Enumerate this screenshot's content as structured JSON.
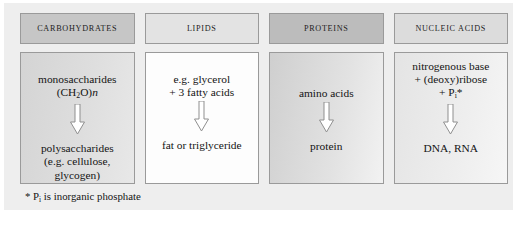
{
  "figure": {
    "columns": [
      {
        "header": "CARBOHYDRATES",
        "header_shade": "shade-a",
        "body_shade": "shade-a",
        "substrate_lines": [
          "monosaccharides",
          "(CH2O)n"
        ],
        "substrate_html": "monosaccharides<br>(CH<sub>2</sub>O)<span class=\"ital\">n</span>",
        "arrow": "down-block-arrow",
        "product_lines": [
          "polysaccharides",
          "(e.g. cellulose,",
          "glycogen)"
        ],
        "product_html": "polysaccharides<br>(e.g. cellulose,<br>glycogen)"
      },
      {
        "header": "LIPIDS",
        "header_shade": "shade-b",
        "body_shade": "shade-b",
        "substrate_lines": [
          "e.g. glycerol",
          "+ 3 fatty acids"
        ],
        "substrate_html": "e.g. glycerol<br>+ 3 fatty acids",
        "arrow": "down-block-arrow",
        "product_lines": [
          "fat or triglyceride"
        ],
        "product_html": "fat or triglyceride"
      },
      {
        "header": "PROTEINS",
        "header_shade": "shade-c",
        "body_shade": "shade-c",
        "substrate_lines": [
          "amino acids"
        ],
        "substrate_html": "amino acids",
        "arrow": "down-block-arrow",
        "product_lines": [
          "protein"
        ],
        "product_html": "protein"
      },
      {
        "header": "NUCLEIC ACIDS",
        "header_shade": "shade-d",
        "body_shade": "shade-d",
        "substrate_lines": [
          "nitrogenous base",
          "+ (deoxy)ribose",
          "+ Pi*"
        ],
        "substrate_html": "nitrogenous base<br>+ (deoxy)ribose<br>+ P<sub>i</sub>*",
        "arrow": "down-block-arrow",
        "product_lines": [
          "DNA, RNA"
        ],
        "product_html": "DNA, RNA"
      }
    ],
    "footnote": "* Pi is inorganic phosphate",
    "footnote_html": "* P<sub>i</sub> is inorganic phosphate"
  },
  "colors": {
    "panel_background": "#eeeeee",
    "page_background": "#ffffff",
    "box_border": "#9a9a9a",
    "text": "#141414"
  }
}
